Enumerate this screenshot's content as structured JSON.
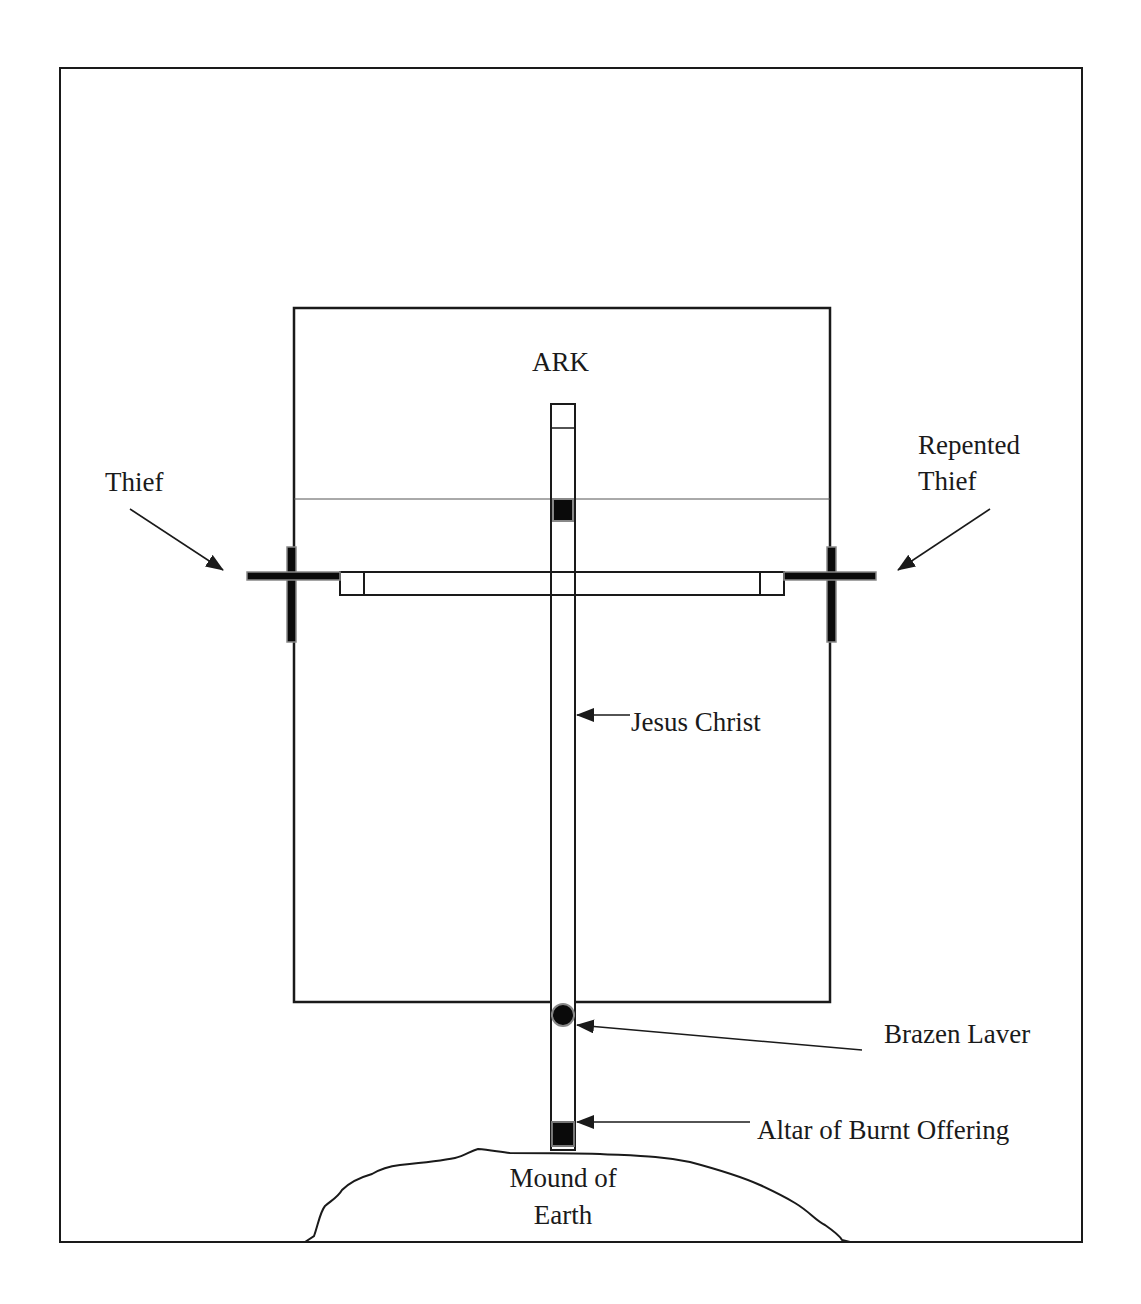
{
  "diagram": {
    "colors": {
      "line": "#1a1a1a",
      "fill_dark": "#0a0a0a",
      "fill_edge": "#888888",
      "background": "#ffffff"
    },
    "labels": {
      "ark": "ARK",
      "thief": "Thief",
      "repented_thief_line1": "Repented",
      "repented_thief_line2": "Thief",
      "jesus_christ": "Jesus Christ",
      "brazen_laver": "Brazen Laver",
      "altar": "Altar of Burnt Offering",
      "mound_line1": "Mound of",
      "mound_line2": "Earth"
    },
    "elements": [
      {
        "id": "outer-frame",
        "shape": "rectangle"
      },
      {
        "id": "ark",
        "shape": "rectangle"
      },
      {
        "id": "central-cross",
        "shape": "vertical-beam-with-crossbar"
      },
      {
        "id": "thief-cross",
        "shape": "cross",
        "side": "left"
      },
      {
        "id": "repented-thief-cross",
        "shape": "cross",
        "side": "right"
      },
      {
        "id": "brazen-laver",
        "shape": "circle"
      },
      {
        "id": "altar-of-burnt-offering",
        "shape": "square"
      },
      {
        "id": "mound-of-earth",
        "shape": "hill"
      }
    ]
  }
}
